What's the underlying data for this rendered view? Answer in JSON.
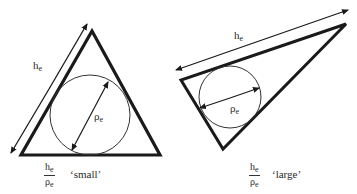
{
  "figure": {
    "left_panel": {
      "name": "small-aspect-triangle",
      "edge_label": "h",
      "edge_label_sub": "e",
      "radius_label": "ρ",
      "radius_label_sub": "e",
      "ratio_numerator": "h",
      "ratio_numerator_sub": "e",
      "ratio_denominator": "ρ",
      "ratio_denominator_sub": "e",
      "ratio_descriptor": "‘small’"
    },
    "right_panel": {
      "name": "large-aspect-triangle",
      "edge_label": "h",
      "edge_label_sub": "e",
      "radius_label": "ρ",
      "radius_label_sub": "e",
      "ratio_numerator": "h",
      "ratio_numerator_sub": "e",
      "ratio_denominator": "ρ",
      "ratio_denominator_sub": "e",
      "ratio_descriptor": "‘large’"
    },
    "colors": {
      "stroke": "#1a1a1a",
      "background": "#ffffff"
    }
  }
}
